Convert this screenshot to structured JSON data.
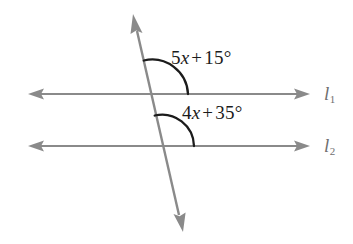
{
  "figure": {
    "type": "geometry-diagram",
    "background_color": "#ffffff",
    "line_color": "#8a8a8a",
    "arc_color": "#1b1b1b",
    "text_color": "#1b1b1b",
    "label_color": "#6f6f6f"
  },
  "lines": {
    "line1": {
      "name": "l",
      "subscript": "1",
      "y": 94,
      "x_start": 28,
      "x_end": 310
    },
    "line2": {
      "name": "l",
      "subscript": "2",
      "y": 146,
      "x_start": 28,
      "x_end": 310
    },
    "transversal": {
      "x_top": 133,
      "y_top": 14,
      "x_bottom": 183,
      "y_bottom": 232
    }
  },
  "intersections": {
    "with_line1": {
      "x": 152,
      "y": 94
    },
    "with_line2": {
      "x": 162,
      "y": 146
    }
  },
  "angles": [
    {
      "id": "angle-top",
      "coefficient": "5",
      "variable": "x",
      "operator": "+",
      "constant": "15",
      "unit": "°",
      "expression": "5x + 15°",
      "vertex": {
        "x": 152,
        "y": 94
      },
      "arc_radius": 36
    },
    {
      "id": "angle-bottom",
      "coefficient": "4",
      "variable": "x",
      "operator": "+",
      "constant": "35",
      "unit": "°",
      "expression": "4x + 35°",
      "vertex": {
        "x": 162,
        "y": 146
      },
      "arc_radius": 32
    }
  ]
}
